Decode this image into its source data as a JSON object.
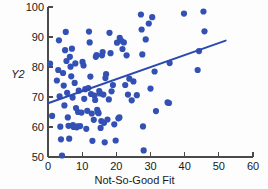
{
  "chart_data": {
    "type": "scatter",
    "title": "",
    "xlabel": "Not-So-Good Fit",
    "ylabel": "Y2",
    "xlim": [
      0,
      60
    ],
    "ylim": [
      50,
      100
    ],
    "xticks": [
      0,
      10,
      20,
      30,
      40,
      50,
      60
    ],
    "yticks": [
      50,
      60,
      70,
      80,
      90,
      100
    ],
    "grid": false,
    "legend": null,
    "marker_color": "#3350b4",
    "marker_size": 3.1,
    "line_color": "#2b49ae",
    "line_width": 1.9,
    "fit_line": {
      "name": "least-squares fit",
      "x_start": 0.2,
      "y_start": 68.0,
      "x_end": 52.0,
      "y_end": 88.8,
      "slope": 0.401,
      "intercept": 67.92
    },
    "series": [
      {
        "name": "Y2 vs Not-So-Good Fit",
        "points": [
          [
            0.6,
            81.1
          ],
          [
            1.2,
            63.7
          ],
          [
            2.6,
            75.5
          ],
          [
            3.0,
            79.0
          ],
          [
            3.2,
            88.9
          ],
          [
            3.4,
            70.2
          ],
          [
            3.6,
            60.1
          ],
          [
            3.8,
            55.9
          ],
          [
            4.1,
            50.5
          ],
          [
            4.4,
            78.0
          ],
          [
            4.6,
            73.8
          ],
          [
            4.8,
            67.2
          ],
          [
            5.0,
            85.6
          ],
          [
            5.2,
            91.7
          ],
          [
            5.4,
            82.0
          ],
          [
            5.6,
            71.4
          ],
          [
            5.8,
            63.2
          ],
          [
            6.0,
            60.4
          ],
          [
            6.2,
            56.1
          ],
          [
            6.4,
            83.4
          ],
          [
            6.6,
            80.1
          ],
          [
            6.8,
            76.9
          ],
          [
            7.0,
            86.1
          ],
          [
            7.2,
            69.8
          ],
          [
            7.3,
            60.6
          ],
          [
            7.5,
            60.0
          ],
          [
            7.8,
            74.7
          ],
          [
            8.0,
            81.2
          ],
          [
            8.2,
            66.3
          ],
          [
            8.4,
            59.9
          ],
          [
            8.6,
            60.2
          ],
          [
            8.8,
            65.0
          ],
          [
            9.0,
            72.1
          ],
          [
            9.4,
            60.3
          ],
          [
            9.8,
            64.8
          ],
          [
            10.1,
            81.7
          ],
          [
            10.4,
            80.5
          ],
          [
            10.6,
            69.4
          ],
          [
            10.9,
            72.6
          ],
          [
            11.2,
            59.4
          ],
          [
            11.5,
            65.4
          ],
          [
            11.8,
            73.0
          ],
          [
            12.0,
            91.8
          ],
          [
            12.2,
            88.2
          ],
          [
            12.4,
            76.8
          ],
          [
            12.6,
            71.0
          ],
          [
            12.8,
            64.5
          ],
          [
            13.0,
            55.4
          ],
          [
            13.4,
            62.4
          ],
          [
            13.6,
            70.5
          ],
          [
            13.8,
            69.0
          ],
          [
            14.0,
            83.4
          ],
          [
            14.2,
            84.0
          ],
          [
            14.4,
            65.7
          ],
          [
            14.6,
            64.9
          ],
          [
            14.8,
            64.6
          ],
          [
            15.0,
            72.0
          ],
          [
            15.2,
            71.2
          ],
          [
            15.4,
            59.7
          ],
          [
            15.6,
            62.0
          ],
          [
            15.8,
            83.9
          ],
          [
            16.0,
            85.0
          ],
          [
            16.2,
            70.8
          ],
          [
            16.4,
            61.4
          ],
          [
            16.6,
            54.9
          ],
          [
            16.8,
            76.3
          ],
          [
            17.0,
            77.6
          ],
          [
            17.4,
            62.5
          ],
          [
            17.8,
            69.2
          ],
          [
            18.0,
            91.4
          ],
          [
            18.3,
            84.6
          ],
          [
            18.6,
            71.9
          ],
          [
            19.0,
            74.0
          ],
          [
            19.4,
            60.9
          ],
          [
            19.8,
            55.5
          ],
          [
            20.2,
            88.1
          ],
          [
            20.6,
            62.9
          ],
          [
            20.9,
            63.2
          ],
          [
            21.0,
            89.7
          ],
          [
            21.4,
            88.8
          ],
          [
            21.8,
            86.0
          ],
          [
            22.2,
            88.2
          ],
          [
            22.6,
            74.0
          ],
          [
            23.0,
            83.9
          ],
          [
            23.4,
            70.8
          ],
          [
            23.8,
            76.1
          ],
          [
            24.5,
            68.9
          ],
          [
            25.0,
            75.2
          ],
          [
            26.0,
            70.6
          ],
          [
            27.2,
            97.5
          ],
          [
            27.4,
            92.5
          ],
          [
            27.6,
            84.2
          ],
          [
            27.8,
            60.2
          ],
          [
            28.0,
            52.2
          ],
          [
            28.6,
            89.2
          ],
          [
            29.5,
            94.5
          ],
          [
            30.0,
            72.8
          ],
          [
            30.5,
            96.6
          ],
          [
            31.2,
            78.5
          ],
          [
            31.6,
            65.3
          ],
          [
            35.0,
            68.2
          ],
          [
            35.4,
            68.0
          ],
          [
            35.6,
            81.3
          ],
          [
            39.8,
            97.8
          ],
          [
            43.8,
            79.0
          ],
          [
            44.2,
            85.3
          ],
          [
            45.5,
            98.5
          ],
          [
            45.8,
            91.9
          ]
        ]
      }
    ]
  }
}
